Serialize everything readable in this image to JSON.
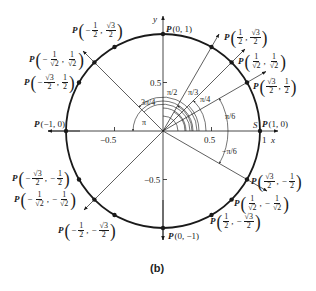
{
  "figure": {
    "caption": "(b)",
    "axis_labels": {
      "x": "x",
      "y": "y"
    },
    "tick_labels": {
      "x_pos": "0.5",
      "x_neg": "−0.5",
      "y_pos": "0.5",
      "y_neg": "−0.5",
      "x_one": "1"
    },
    "start_point_label": "S",
    "angle_labels": {
      "pi6": "π/6",
      "pi4": "π/4",
      "pi3": "π/3",
      "pi2": "π/2",
      "three_pi4": "3π/4",
      "pi": "π",
      "neg_pi6": "−π/6"
    },
    "points": {
      "p_1_0": {
        "P": "P",
        "text": "(1, 0)"
      },
      "p_0_1": {
        "P": "P",
        "text": "(0, 1)"
      },
      "p_m1_0": {
        "P": "P",
        "text": "(−1, 0)"
      },
      "p_0_m1": {
        "P": "P",
        "text": "(0, −1)"
      },
      "q1_60": {
        "P": "P",
        "x_num": "1",
        "x_den": "2",
        "y_num": "√3",
        "y_den": "2"
      },
      "q1_45": {
        "P": "P",
        "x_num": "1",
        "x_den": "√2",
        "y_num": "1",
        "y_den": "√2"
      },
      "q1_30": {
        "P": "P",
        "x_num": "√3",
        "x_den": "2",
        "y_num": "1",
        "y_den": "2"
      },
      "q2_120": {
        "P": "P",
        "x_num": "1",
        "x_den": "2",
        "y_num": "√3",
        "y_den": "2"
      },
      "q2_135": {
        "P": "P",
        "x_num": "1",
        "x_den": "√2",
        "y_num": "1",
        "y_den": "√2"
      },
      "q2_150": {
        "P": "P",
        "x_num": "√3",
        "x_den": "2",
        "y_num": "1",
        "y_den": "2"
      },
      "q3_210": {
        "P": "P",
        "x_num": "√3",
        "x_den": "2",
        "y_num": "1",
        "y_den": "2"
      },
      "q3_225": {
        "P": "P",
        "x_num": "1",
        "x_den": "√2",
        "y_num": "1",
        "y_den": "√2"
      },
      "q3_240": {
        "P": "P",
        "x_num": "1",
        "x_den": "2",
        "y_num": "√3",
        "y_den": "2"
      },
      "q4_300": {
        "P": "P",
        "x_num": "1",
        "x_den": "2",
        "y_num": "√3",
        "y_den": "2"
      },
      "q4_315": {
        "P": "P",
        "x_num": "1",
        "x_den": "√2",
        "y_num": "1",
        "y_den": "√2"
      },
      "q4_330": {
        "P": "P",
        "x_num": "√3",
        "x_den": "2",
        "y_num": "1",
        "y_den": "2"
      }
    },
    "minus": "−",
    "comma": ","
  }
}
